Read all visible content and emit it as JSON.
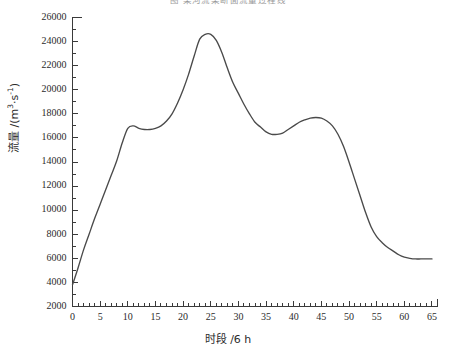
{
  "figure": {
    "title": "图    某河流某断面流量过程线",
    "title_visible": "partially-cropped"
  },
  "axes": {
    "x_title": "时段 /6 h",
    "y_title_main": "流量 /(m",
    "y_title_sup1": "3",
    "y_title_mid": "·s",
    "y_title_sup2": "-1",
    "y_title_end": ")",
    "y_title_plain": "流量 /(m3·s-1)"
  },
  "chart_data": {
    "type": "line",
    "title": "图    某河流某断面流量过程线",
    "xlabel": "时段 /6 h",
    "ylabel": "流量 /(m3·s-1)",
    "xlim": [
      0,
      66
    ],
    "ylim": [
      2000,
      26000
    ],
    "xticks": [
      0,
      5,
      10,
      15,
      20,
      25,
      30,
      35,
      40,
      45,
      50,
      55,
      60,
      65
    ],
    "yticks": [
      2000,
      4000,
      6000,
      8000,
      10000,
      12000,
      14000,
      16000,
      18000,
      20000,
      22000,
      24000,
      26000
    ],
    "xtick_labels": [
      "0",
      "5",
      "10",
      "15",
      "20",
      "25",
      "30",
      "35",
      "40",
      "45",
      "50",
      "55",
      "60",
      "65"
    ],
    "ytick_labels": [
      "2000",
      "4000",
      "6000",
      "8000",
      "10000",
      "12000",
      "14000",
      "16000",
      "18000",
      "20000",
      "22000",
      "24000",
      "26000"
    ],
    "minor_xticks_every": 1,
    "minor_yticks_every": 1000,
    "grid": false,
    "legend": null,
    "series": [
      {
        "name": "流量过程线",
        "color": "#4a4a4a",
        "x": [
          0,
          1,
          2,
          3,
          4,
          5,
          6,
          7,
          8,
          9,
          10,
          11,
          12,
          13,
          14,
          15,
          16,
          17,
          18,
          19,
          20,
          21,
          22,
          23,
          24,
          25,
          26,
          27,
          28,
          29,
          30,
          31,
          32,
          33,
          34,
          35,
          36,
          37,
          38,
          39,
          40,
          41,
          42,
          43,
          44,
          45,
          46,
          47,
          48,
          49,
          50,
          51,
          52,
          53,
          54,
          55,
          56,
          57,
          58,
          59,
          60,
          61,
          62,
          63,
          64,
          65
        ],
        "values": [
          3800,
          5200,
          6700,
          8000,
          9300,
          10500,
          11700,
          12900,
          14100,
          15600,
          16800,
          17000,
          16800,
          16700,
          16700,
          16800,
          17000,
          17400,
          18000,
          18900,
          20000,
          21300,
          22800,
          24200,
          24600,
          24600,
          24100,
          23100,
          21800,
          20600,
          19700,
          18800,
          18000,
          17300,
          16900,
          16500,
          16300,
          16300,
          16400,
          16700,
          17000,
          17300,
          17500,
          17650,
          17700,
          17650,
          17400,
          17000,
          16300,
          15300,
          14000,
          12600,
          11200,
          9800,
          8600,
          7800,
          7300,
          6900,
          6600,
          6300,
          6100,
          6000,
          5950,
          5950,
          5950,
          5950
        ]
      }
    ]
  }
}
